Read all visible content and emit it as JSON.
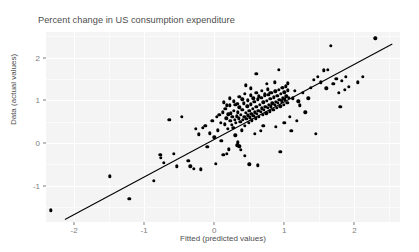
{
  "chart_data": {
    "type": "scatter",
    "title": "Percent change in US consumption expenditure",
    "xlabel": "Fitted (predicted values)",
    "ylabel": "Data (actual values)",
    "xlim": [
      -2.4,
      2.65
    ],
    "ylim": [
      -1.85,
      2.6
    ],
    "xticks": [
      -2,
      -1,
      0,
      1,
      2
    ],
    "xtick_labels": [
      "-2",
      "-1",
      "0",
      "1",
      "2"
    ],
    "yticks": [
      -1,
      0,
      1,
      2
    ],
    "ytick_labels": [
      "-1",
      "0",
      "1",
      "2"
    ],
    "grid": true,
    "grid_color": "#ffffff",
    "panel_background": "#f4f4f4",
    "point_color": "#000000",
    "line_color": "#000000",
    "legend": null,
    "reference_line": {
      "name": "identity-line",
      "x": [
        -2.13,
        2.54
      ],
      "y": [
        -1.79,
        2.32
      ]
    },
    "series": [
      {
        "name": "observations",
        "marker": "filled-circle",
        "points": [
          [
            -2.33,
            -1.58
          ],
          [
            -1.49,
            -0.78
          ],
          [
            -1.21,
            -1.31
          ],
          [
            -0.86,
            -0.88
          ],
          [
            -0.77,
            -0.27
          ],
          [
            -0.76,
            -0.34
          ],
          [
            -0.72,
            -0.47
          ],
          [
            -0.64,
            0.55
          ],
          [
            -0.58,
            -0.25
          ],
          [
            -0.53,
            -0.55
          ],
          [
            -0.46,
            0.62
          ],
          [
            -0.37,
            -0.42
          ],
          [
            -0.34,
            -0.55
          ],
          [
            -0.29,
            -0.6
          ],
          [
            -0.26,
            0.33
          ],
          [
            -0.22,
            0.2
          ],
          [
            -0.19,
            -0.62
          ],
          [
            -0.16,
            0.35
          ],
          [
            -0.13,
            0.4
          ],
          [
            -0.1,
            -0.09
          ],
          [
            -0.06,
            0.23
          ],
          [
            -0.03,
            0.52
          ],
          [
            0.0,
            0.13
          ],
          [
            0.02,
            -0.48
          ],
          [
            0.04,
            0.62
          ],
          [
            0.05,
            0.3
          ],
          [
            0.07,
            0.66
          ],
          [
            0.09,
            0.48
          ],
          [
            0.1,
            0.05
          ],
          [
            0.12,
            0.72
          ],
          [
            0.13,
            -0.28
          ],
          [
            0.15,
            0.44
          ],
          [
            0.16,
            0.8
          ],
          [
            0.17,
            0.58
          ],
          [
            0.18,
            -0.25
          ],
          [
            0.19,
            0.33
          ],
          [
            0.2,
            0.67
          ],
          [
            0.21,
            -0.15
          ],
          [
            0.22,
            0.88
          ],
          [
            0.23,
            0.52
          ],
          [
            0.24,
            0.7
          ],
          [
            0.25,
            0.42
          ],
          [
            0.26,
            0.61
          ],
          [
            0.27,
            0.35
          ],
          [
            0.28,
            0.76
          ],
          [
            0.29,
            0.55
          ],
          [
            0.3,
            0.9
          ],
          [
            0.31,
            0.48
          ],
          [
            0.32,
            0.63
          ],
          [
            0.33,
            -0.05
          ],
          [
            0.34,
            0.72
          ],
          [
            0.35,
            0.58
          ],
          [
            0.36,
            0.84
          ],
          [
            0.37,
            0.5
          ],
          [
            0.38,
            0.66
          ],
          [
            0.39,
            0.3
          ],
          [
            0.4,
            0.78
          ],
          [
            0.41,
            0.55
          ],
          [
            0.42,
            0.93
          ],
          [
            0.43,
            0.62
          ],
          [
            0.44,
            0.4
          ],
          [
            0.45,
            0.71
          ],
          [
            0.46,
            0.56
          ],
          [
            0.47,
            0.86
          ],
          [
            0.48,
            0.65
          ],
          [
            0.49,
            0.47
          ],
          [
            0.5,
            0.75
          ],
          [
            0.51,
            0.6
          ],
          [
            0.52,
            0.91
          ],
          [
            0.53,
            0.68
          ],
          [
            0.54,
            0.53
          ],
          [
            0.55,
            0.8
          ],
          [
            0.56,
            0.64
          ],
          [
            0.57,
            0.96
          ],
          [
            0.58,
            0.72
          ],
          [
            0.59,
            0.58
          ],
          [
            0.6,
            0.85
          ],
          [
            0.61,
            0.69
          ],
          [
            0.62,
            1.02
          ],
          [
            0.63,
            0.76
          ],
          [
            0.64,
            0.61
          ],
          [
            0.65,
            0.9
          ],
          [
            0.66,
            0.73
          ],
          [
            0.67,
            1.06
          ],
          [
            0.68,
            0.81
          ],
          [
            0.69,
            0.66
          ],
          [
            0.7,
            0.95
          ],
          [
            0.71,
            0.78
          ],
          [
            0.72,
            1.1
          ],
          [
            0.73,
            0.85
          ],
          [
            0.74,
            0.7
          ],
          [
            0.75,
            0.99
          ],
          [
            0.76,
            0.82
          ],
          [
            0.77,
            1.13
          ],
          [
            0.78,
            0.89
          ],
          [
            0.79,
            0.74
          ],
          [
            0.8,
            1.03
          ],
          [
            0.81,
            0.86
          ],
          [
            0.82,
            1.17
          ],
          [
            0.83,
            0.93
          ],
          [
            0.84,
            0.78
          ],
          [
            0.85,
            1.07
          ],
          [
            0.86,
            0.9
          ],
          [
            0.87,
            1.21
          ],
          [
            0.88,
            0.97
          ],
          [
            0.89,
            0.82
          ],
          [
            0.9,
            1.11
          ],
          [
            0.91,
            0.94
          ],
          [
            0.92,
            1.25
          ],
          [
            0.93,
            1.01
          ],
          [
            0.94,
            0.86
          ],
          [
            0.95,
            1.15
          ],
          [
            0.96,
            0.98
          ],
          [
            0.97,
            1.29
          ],
          [
            0.98,
            1.05
          ],
          [
            0.99,
            0.9
          ],
          [
            1.0,
            1.19
          ],
          [
            1.01,
            1.02
          ],
          [
            1.02,
            1.33
          ],
          [
            1.03,
            1.09
          ],
          [
            1.04,
            0.94
          ],
          [
            1.05,
            1.23
          ],
          [
            1.06,
            1.06
          ],
          [
            0.36,
            1.08
          ],
          [
            0.4,
            1.02
          ],
          [
            0.44,
            1.15
          ],
          [
            0.48,
            1.0
          ],
          [
            0.52,
            1.12
          ],
          [
            0.56,
            1.05
          ],
          [
            0.6,
            1.18
          ],
          [
            0.64,
            1.09
          ],
          [
            0.68,
            1.22
          ],
          [
            0.72,
            1.14
          ],
          [
            0.76,
            1.26
          ],
          [
            0.8,
            1.18
          ],
          [
            0.28,
            0.98
          ],
          [
            0.33,
            0.92
          ],
          [
            0.22,
            1.05
          ],
          [
            0.18,
            0.88
          ],
          [
            0.14,
            0.95
          ],
          [
            0.6,
            1.62
          ],
          [
            0.45,
            1.35
          ],
          [
            0.92,
            1.72
          ],
          [
            0.86,
            1.42
          ],
          [
            0.75,
            1.38
          ],
          [
            0.52,
            1.28
          ],
          [
            0.3,
            0.18
          ],
          [
            0.34,
            0.02
          ],
          [
            0.36,
            -0.08
          ],
          [
            0.38,
            -0.16
          ],
          [
            0.44,
            -0.3
          ],
          [
            0.5,
            -0.5
          ],
          [
            0.62,
            -0.52
          ],
          [
            0.94,
            -0.2
          ],
          [
            1.1,
            0.28
          ],
          [
            1.18,
            0.52
          ],
          [
            1.22,
            0.88
          ],
          [
            1.26,
            1.18
          ],
          [
            1.3,
            0.72
          ],
          [
            1.34,
            1.05
          ],
          [
            1.38,
            1.3
          ],
          [
            1.42,
            1.48
          ],
          [
            1.45,
            0.22
          ],
          [
            1.48,
            1.55
          ],
          [
            1.52,
            1.42
          ],
          [
            1.56,
            1.7
          ],
          [
            1.6,
            1.28
          ],
          [
            1.62,
            1.72
          ],
          [
            1.66,
            2.28
          ],
          [
            1.7,
            1.38
          ],
          [
            1.74,
            1.5
          ],
          [
            1.78,
            1.18
          ],
          [
            1.8,
            0.85
          ],
          [
            1.82,
            1.45
          ],
          [
            1.86,
            1.25
          ],
          [
            1.88,
            1.55
          ],
          [
            1.92,
            1.32
          ],
          [
            2.05,
            1.42
          ],
          [
            2.12,
            1.55
          ],
          [
            2.3,
            2.45
          ],
          [
            1.12,
            1.05
          ],
          [
            1.15,
            1.22
          ],
          [
            1.05,
            1.4
          ],
          [
            0.98,
            1.3
          ],
          [
            1.08,
            0.62
          ],
          [
            1.2,
            0.98
          ],
          [
            0.66,
            0.28
          ],
          [
            0.7,
            0.4
          ],
          [
            0.58,
            0.22
          ],
          [
            1.0,
            0.48
          ],
          [
            0.88,
            0.38
          ]
        ]
      }
    ]
  }
}
